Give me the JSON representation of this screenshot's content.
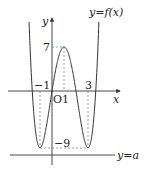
{
  "diagram": {
    "type": "function-graph",
    "curve_label": "y=f(x)",
    "line_label": "y=a",
    "axes": {
      "x_label": "x",
      "y_label": "y",
      "origin_label": "O"
    },
    "ticks": {
      "x": [
        {
          "value": -1,
          "label": "−1"
        },
        {
          "value": 1,
          "label": "1"
        },
        {
          "value": 3,
          "label": "3"
        }
      ],
      "y": [
        {
          "value": 7,
          "label": "7"
        },
        {
          "value": -9,
          "label": "−9"
        }
      ]
    },
    "key_points": [
      {
        "x": -1,
        "y": -9,
        "kind": "local minimum"
      },
      {
        "x": 1,
        "y": 7,
        "kind": "local maximum"
      },
      {
        "x": 3,
        "y": -9,
        "kind": "local minimum"
      }
    ],
    "function": "f(x) = x^4 - 4x^3 - 2x^2 + 12x",
    "horizontal_line_y": "a (below -9)",
    "colors": {
      "curve": "#333333",
      "axis": "#333333",
      "dashed": "#777777"
    }
  }
}
